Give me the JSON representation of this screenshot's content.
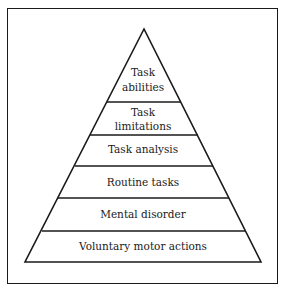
{
  "diagram": {
    "type": "pyramid",
    "levels_top_to_bottom": [
      {
        "line1": "Task",
        "line2": "abilities"
      },
      {
        "line1": "Task",
        "line2": "limitations"
      },
      {
        "line1": "Task analysis"
      },
      {
        "line1": "Routine tasks"
      },
      {
        "line1": "Mental disorder"
      },
      {
        "line1": "Voluntary motor actions"
      }
    ],
    "colors": {
      "stroke": "#1a1a1a",
      "background": "#ffffff"
    }
  }
}
